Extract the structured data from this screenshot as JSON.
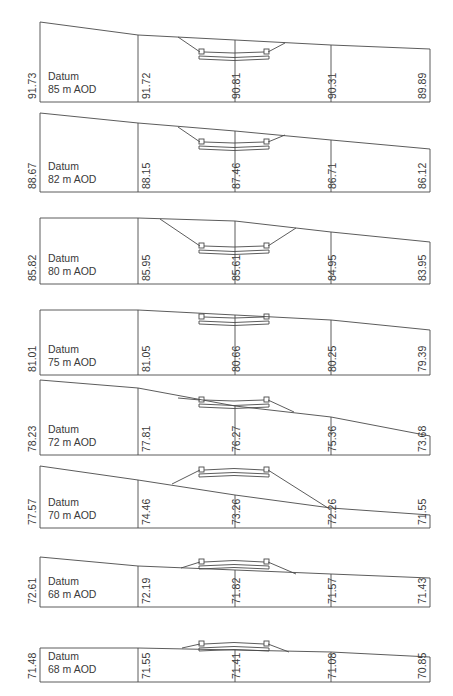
{
  "frame": {
    "x": [
      40,
      138,
      235,
      331,
      430
    ]
  },
  "datum_label": "Datum",
  "sections": [
    {
      "datum": "85 m AOD",
      "levels": [
        "91.73",
        "91.72",
        "90.81",
        "90.31",
        "89.89"
      ],
      "base": 102,
      "ground": [
        22,
        35,
        40,
        45,
        49
      ],
      "bridge": {
        "deckY": 52,
        "banks": [
          [
            178,
            37
          ],
          [
            285,
            43
          ]
        ],
        "mode": "cut"
      }
    },
    {
      "datum": "82 m AOD",
      "levels": [
        "88.67",
        "88.15",
        "87.46",
        "86.71",
        "86.12"
      ],
      "base": 192,
      "ground": [
        113,
        123,
        131,
        140,
        149
      ],
      "bridge": {
        "deckY": 142,
        "banks": [
          [
            178,
            127
          ],
          [
            285,
            135
          ]
        ],
        "mode": "cut"
      }
    },
    {
      "datum": "80 m AOD",
      "levels": [
        "85.82",
        "85.95",
        "85.61",
        "84.95",
        "83.95"
      ],
      "base": 284,
      "ground": [
        218,
        218,
        221,
        232,
        242
      ],
      "bridge": {
        "deckY": 246,
        "banks": [
          [
            160,
            219
          ],
          [
            296,
            228
          ]
        ],
        "mode": "cut"
      }
    },
    {
      "datum": "75 m AOD",
      "levels": [
        "81.01",
        "81.05",
        "80.66",
        "80.25",
        "79.39"
      ],
      "base": 375,
      "ground": [
        310,
        310,
        315,
        320,
        330
      ],
      "bridge": {
        "deckY": 317,
        "banks": null,
        "mode": "flush"
      }
    },
    {
      "datum": "72 m AOD",
      "levels": [
        "78.23",
        "77.81",
        "76.27",
        "75.36",
        "73.68"
      ],
      "base": 455,
      "ground": [
        380,
        388,
        406,
        417,
        436
      ],
      "bridge": {
        "deckY": 400,
        "banks": [
          [
            178,
            398
          ],
          [
            294,
            412
          ]
        ],
        "mode": "mixed"
      }
    },
    {
      "datum": "70 m AOD",
      "levels": [
        "77.57",
        "74.46",
        "73.26",
        "72.26",
        "71.55"
      ],
      "base": 528,
      "ground": [
        466,
        480,
        495,
        508,
        515
      ],
      "bridge": {
        "deckY": 470,
        "banks": [
          [
            172,
            484
          ],
          [
            328,
            508
          ]
        ],
        "mode": "fill"
      }
    },
    {
      "datum": "68 m AOD",
      "levels": [
        "72.61",
        "72.19",
        "71.82",
        "71.57",
        "71.43"
      ],
      "base": 607,
      "ground": [
        557,
        566,
        570,
        574,
        578
      ],
      "bridge": {
        "deckY": 562,
        "banks": [
          [
            181,
            568
          ],
          [
            296,
            574
          ]
        ],
        "mode": "fill"
      }
    },
    {
      "datum": "68 m AOD",
      "levels": [
        "71.48",
        "71.55",
        "71.41",
        "71.08",
        "70.85"
      ],
      "base": 682,
      "ground": [
        648,
        648,
        650,
        652,
        657
      ],
      "bridge": {
        "deckY": 644,
        "banks": [
          [
            182,
            648
          ],
          [
            289,
            652
          ]
        ],
        "mode": "fill"
      }
    }
  ]
}
